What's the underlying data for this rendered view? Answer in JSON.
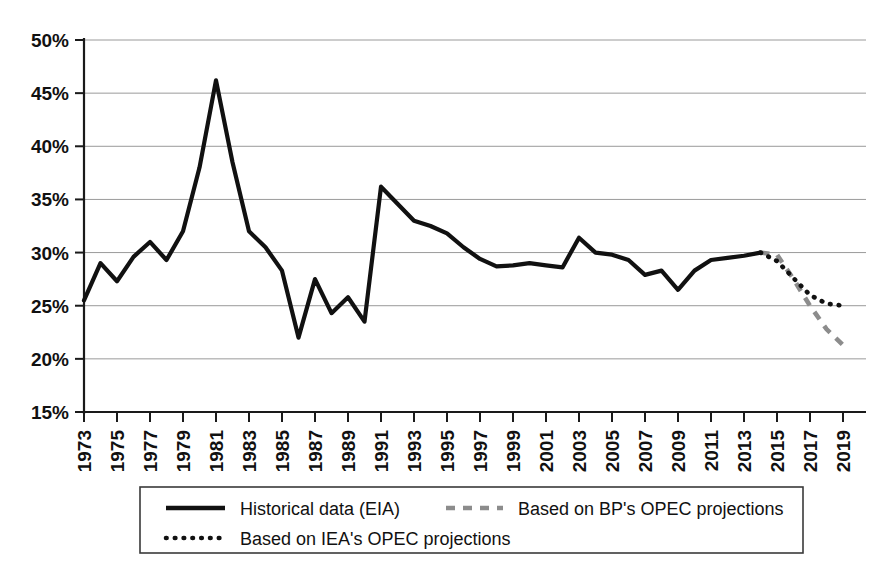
{
  "chart_data": {
    "type": "line",
    "title": "",
    "subtitle": "",
    "xlabel": "",
    "ylabel": "",
    "xlim": [
      1973,
      2019
    ],
    "ylim": [
      15,
      50
    ],
    "ytick_step": 5,
    "xtick_step": 2,
    "grid": true,
    "legend_position": "bottom",
    "ytick_labels": [
      "15%",
      "20%",
      "25%",
      "30%",
      "35%",
      "40%",
      "45%",
      "50%"
    ],
    "ytick_values": [
      15,
      20,
      25,
      30,
      35,
      40,
      45,
      50
    ],
    "xtick_labels": [
      "1973",
      "1975",
      "1977",
      "1979",
      "1981",
      "1983",
      "1985",
      "1987",
      "1989",
      "1991",
      "1993",
      "1995",
      "1997",
      "1999",
      "2001",
      "2003",
      "2005",
      "2007",
      "2009",
      "2011",
      "2013",
      "2015",
      "2017",
      "2019"
    ],
    "xtick_values": [
      1973,
      1975,
      1977,
      1979,
      1981,
      1983,
      1985,
      1987,
      1989,
      1991,
      1993,
      1995,
      1997,
      1999,
      2001,
      2003,
      2005,
      2007,
      2009,
      2011,
      2013,
      2015,
      2017,
      2019
    ],
    "series": [
      {
        "name": "Historical data (EIA)",
        "style": "solid",
        "color": "#111111",
        "x": [
          1973,
          1974,
          1975,
          1976,
          1977,
          1978,
          1979,
          1980,
          1981,
          1982,
          1983,
          1984,
          1985,
          1986,
          1987,
          1988,
          1989,
          1990,
          1991,
          1992,
          1993,
          1994,
          1995,
          1996,
          1997,
          1998,
          1999,
          2000,
          2001,
          2002,
          2003,
          2004,
          2005,
          2006,
          2007,
          2008,
          2009,
          2010,
          2011,
          2012,
          2013,
          2014
        ],
        "values": [
          25.5,
          29.0,
          27.3,
          29.6,
          31.0,
          29.3,
          32.0,
          38.0,
          46.2,
          38.5,
          32.0,
          30.5,
          28.3,
          22.0,
          27.5,
          24.3,
          25.8,
          23.5,
          36.2,
          34.6,
          33.0,
          32.5,
          31.8,
          30.5,
          29.4,
          28.7,
          28.8,
          29.0,
          28.8,
          28.6,
          31.4,
          30.0,
          29.8,
          29.3,
          27.9,
          28.3,
          26.5,
          28.3,
          29.3,
          29.5,
          29.7,
          30.0
        ]
      },
      {
        "name": "Based on BP's OPEC projections",
        "style": "dashed",
        "color": "#8c8c8c",
        "x": [
          2014,
          2015,
          2016,
          2017,
          2018,
          2019
        ],
        "values": [
          30.0,
          29.8,
          27.5,
          25.0,
          22.8,
          21.3
        ]
      },
      {
        "name": "Based on IEA's OPEC projections",
        "style": "dotted",
        "color": "#111111",
        "x": [
          2014,
          2015,
          2016,
          2017,
          2018,
          2019
        ],
        "values": [
          30.0,
          29.2,
          27.6,
          26.0,
          25.2,
          25.0
        ]
      }
    ]
  },
  "legend": {
    "entries": [
      {
        "label": "Historical data (EIA)",
        "style": "solid"
      },
      {
        "label": "Based on BP's OPEC projections",
        "style": "dashed"
      },
      {
        "label": "Based on IEA's OPEC projections",
        "style": "dotted"
      }
    ]
  }
}
